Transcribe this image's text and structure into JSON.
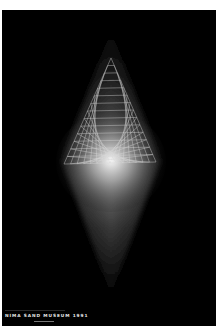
{
  "poster": {
    "caption": "NIMA SAND MUSEUM 1991",
    "background": "#000000",
    "border": "#ffffff",
    "figure": {
      "type": "wireframe-pyramid-with-light-glow",
      "apex": [
        111,
        58
      ],
      "base_left": [
        64,
        164
      ],
      "base_right": [
        156,
        162
      ],
      "glow_top": [
        111,
        30
      ],
      "glow_bottom": [
        111,
        295
      ],
      "glow_center": [
        111,
        160
      ],
      "line_color": "#d8d8d8"
    }
  }
}
